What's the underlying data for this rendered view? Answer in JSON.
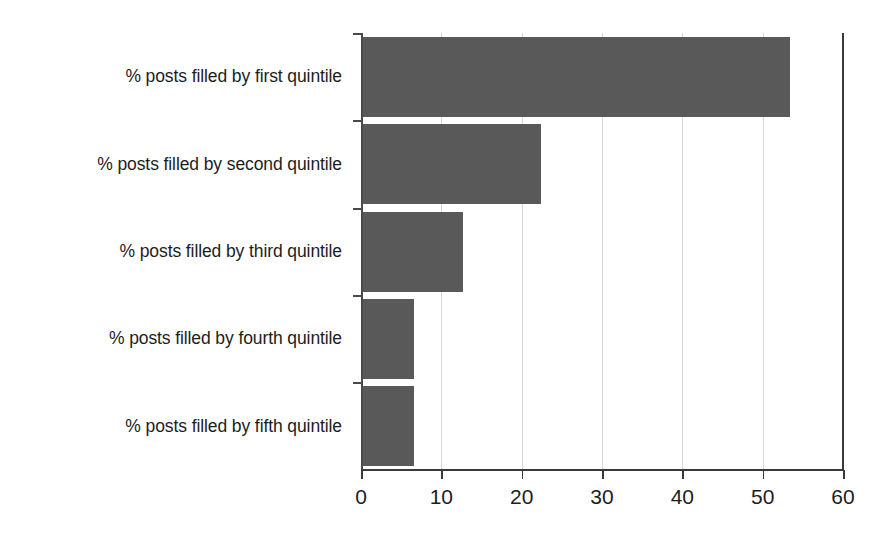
{
  "chart_data": {
    "type": "bar",
    "orientation": "horizontal",
    "title": "",
    "subtitle": "",
    "xlabel": "",
    "ylabel": "",
    "categories": [
      "% posts filled by first quintile",
      "% posts filled by second quintile",
      "% posts filled by third quintile",
      "% posts filled by fourth quintile",
      "% posts filled by fifth quintile"
    ],
    "values": [
      53.4,
      22.4,
      12.7,
      6.6,
      6.6
    ],
    "xlim": [
      0,
      60
    ],
    "xticks": [
      0,
      10,
      20,
      30,
      40,
      50,
      60
    ],
    "xtick_labels": [
      "0",
      "10",
      "20",
      "30",
      "40",
      "50",
      "60"
    ],
    "grid": true,
    "grid_axis": "x",
    "legend": false,
    "legend_position": "none",
    "bar_color": "#595959",
    "grid_color": "#d8d8d8",
    "axis_color": "#3a3a3a",
    "text_color": "#1d1d1d",
    "background_color": "#ffffff"
  }
}
